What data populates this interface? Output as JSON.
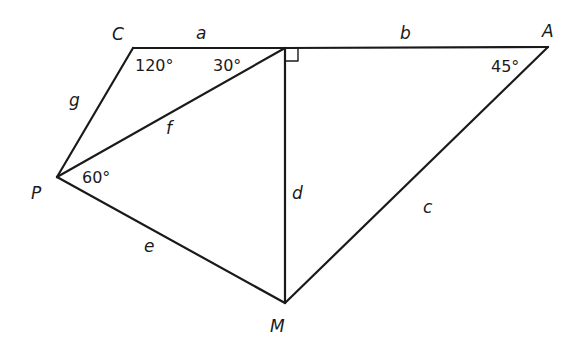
{
  "diagram": {
    "type": "geometry-figure",
    "vertices": {
      "C": {
        "label": "C",
        "x": 133,
        "y": 48
      },
      "T": {
        "label": "",
        "x": 285,
        "y": 48
      },
      "A": {
        "label": "A",
        "x": 548,
        "y": 47
      },
      "P": {
        "label": "P",
        "x": 57,
        "y": 177
      },
      "M": {
        "label": "M",
        "x": 285,
        "y": 303
      }
    },
    "segments": [
      {
        "from": "C",
        "to": "T",
        "label": "a"
      },
      {
        "from": "T",
        "to": "A",
        "label": "b"
      },
      {
        "from": "A",
        "to": "M",
        "label": "c"
      },
      {
        "from": "T",
        "to": "M",
        "label": "d"
      },
      {
        "from": "P",
        "to": "M",
        "label": "e"
      },
      {
        "from": "P",
        "to": "T",
        "label": "f"
      },
      {
        "from": "C",
        "to": "P",
        "label": "g"
      }
    ],
    "angles": [
      {
        "at": "C",
        "value": "120°"
      },
      {
        "at": "T",
        "value": "30°",
        "between": "C-T-P"
      },
      {
        "at": "A",
        "value": "45°"
      },
      {
        "at": "P",
        "value": "60°",
        "between": "T-P-M"
      },
      {
        "at": "T",
        "value": "right angle",
        "between": "A-T-M"
      }
    ],
    "labels": {
      "C": "C",
      "A": "A",
      "P": "P",
      "M": "M",
      "a": "a",
      "b": "b",
      "c": "c",
      "d": "d",
      "e": "e",
      "f": "f",
      "g": "g",
      "angle_C": "120°",
      "angle_T": "30°",
      "angle_A": "45°",
      "angle_P": "60°"
    }
  }
}
